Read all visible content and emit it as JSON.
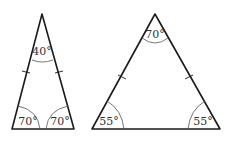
{
  "figure": {
    "triangles": [
      {
        "id": "left",
        "type": "isosceles",
        "angles": {
          "apex": "40°",
          "base_left": "70°",
          "base_right": "70°"
        },
        "equal_sides_marked": true
      },
      {
        "id": "right",
        "type": "isosceles",
        "angles": {
          "apex": "70°",
          "base_left": "55°",
          "base_right": "55°"
        },
        "equal_sides_marked": true
      }
    ]
  }
}
